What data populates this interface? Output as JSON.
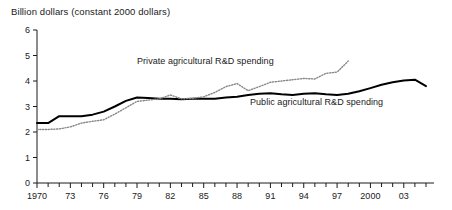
{
  "chart_data": {
    "type": "line",
    "title": "Billion dollars (constant 2000 dollars)",
    "subtitle": "",
    "xlabel": "",
    "ylabel": "Billion dollars (constant 2000 dollars)",
    "xlim": [
      1970,
      2005
    ],
    "ylim": [
      0,
      6
    ],
    "grid": false,
    "legend_position": "inline-annotation",
    "y_ticks": [
      "0",
      "1",
      "2",
      "3",
      "4",
      "5",
      "6"
    ],
    "y_tick_values": [
      0,
      1,
      2,
      3,
      4,
      5,
      6
    ],
    "x_ticks": [
      "1970",
      "73",
      "76",
      "79",
      "82",
      "85",
      "88",
      "91",
      "94",
      "97",
      "2000",
      "03"
    ],
    "x_tick_values": [
      1970,
      1973,
      1976,
      1979,
      1982,
      1985,
      1988,
      1991,
      1994,
      1997,
      2000,
      2003
    ],
    "x_minor_tick_values": [
      1971,
      1972,
      1974,
      1975,
      1977,
      1978,
      1980,
      1981,
      1983,
      1984,
      1986,
      1987,
      1989,
      1990,
      1992,
      1993,
      1995,
      1996,
      1998,
      1999,
      2001,
      2002,
      2004,
      2005
    ],
    "annotations": [
      {
        "name": "private-series-label",
        "text": "Private agricultural R&D spending",
        "x": 1979,
        "y": 4.55
      },
      {
        "name": "public-series-label",
        "text": "Public agricultural R&D spending",
        "x": 1989,
        "y": 3.0
      }
    ],
    "series": [
      {
        "name": "Public agricultural R&D spending",
        "style": "solid",
        "color": "#000000",
        "line_width": 2.0,
        "x": [
          1970,
          1971,
          1972,
          1973,
          1974,
          1975,
          1976,
          1977,
          1978,
          1979,
          1980,
          1981,
          1982,
          1983,
          1984,
          1985,
          1986,
          1987,
          1988,
          1989,
          1990,
          1991,
          1992,
          1993,
          1994,
          1995,
          1996,
          1997,
          1998,
          1999,
          2000,
          2001,
          2002,
          2003,
          2004,
          2005
        ],
        "values": [
          2.35,
          2.35,
          2.62,
          2.62,
          2.62,
          2.68,
          2.8,
          3.0,
          3.22,
          3.35,
          3.33,
          3.3,
          3.3,
          3.28,
          3.3,
          3.3,
          3.3,
          3.35,
          3.38,
          3.45,
          3.5,
          3.52,
          3.48,
          3.45,
          3.5,
          3.52,
          3.48,
          3.45,
          3.5,
          3.6,
          3.72,
          3.85,
          3.95,
          4.02,
          4.05,
          3.8
        ]
      },
      {
        "name": "Private agricultural R&D spending",
        "style": "dotted",
        "color": "#888888",
        "line_width": 1.4,
        "x": [
          1970,
          1971,
          1972,
          1973,
          1974,
          1975,
          1976,
          1977,
          1978,
          1979,
          1980,
          1981,
          1982,
          1983,
          1984,
          1985,
          1986,
          1987,
          1988,
          1989,
          1990,
          1991,
          1992,
          1993,
          1994,
          1995,
          1996,
          1997,
          1998
        ],
        "values": [
          2.1,
          2.1,
          2.12,
          2.2,
          2.35,
          2.42,
          2.48,
          2.7,
          2.95,
          3.2,
          3.25,
          3.3,
          3.45,
          3.3,
          3.32,
          3.38,
          3.55,
          3.78,
          3.9,
          3.62,
          3.78,
          3.95,
          4.0,
          4.05,
          4.1,
          4.08,
          4.3,
          4.35,
          4.78
        ]
      }
    ]
  }
}
